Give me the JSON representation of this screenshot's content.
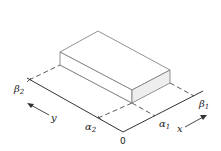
{
  "figure": {
    "labels": {
      "origin": "0",
      "x_axis": "x",
      "y_axis": "y",
      "alpha1": {
        "base": "α",
        "sub": "1"
      },
      "alpha2": {
        "base": "α",
        "sub": "2"
      },
      "beta1": {
        "base": "β",
        "sub": "1"
      },
      "beta2": {
        "base": "β",
        "sub": "2"
      }
    },
    "colors": {
      "line": "#333333",
      "box_edge": "#777777",
      "shaded_face": "#eeeeee"
    }
  }
}
